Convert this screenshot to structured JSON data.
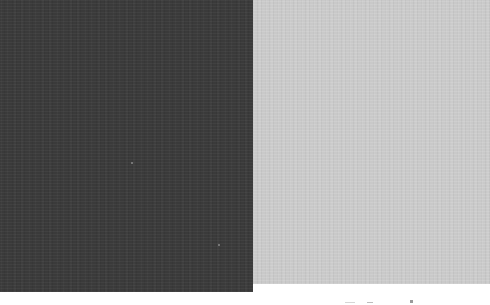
{
  "scene": {
    "description": "Two textured gray swatches side by side on a white background",
    "background_color": "#ffffff",
    "swatches": [
      {
        "name": "dark-swatch",
        "color": "#3a3a3a"
      },
      {
        "name": "light-swatch",
        "color": "#c9c9c9"
      }
    ]
  }
}
